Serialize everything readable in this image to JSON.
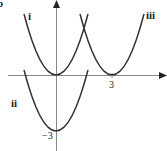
{
  "figure": {
    "part_label": "b",
    "axes": {
      "x_tick_label": "3",
      "y_tick_label": "−3",
      "axis_color": "#888888",
      "curve_color": "#333333"
    },
    "curves": [
      {
        "label": "i",
        "equation_hint": "y = x^2",
        "vertex": [
          0,
          0
        ]
      },
      {
        "label": "ii",
        "equation_hint": "y = x^2 - 3",
        "vertex": [
          0,
          -3
        ]
      },
      {
        "label": "iii",
        "equation_hint": "y = (x - 3)^2",
        "vertex": [
          3,
          0
        ]
      }
    ]
  }
}
